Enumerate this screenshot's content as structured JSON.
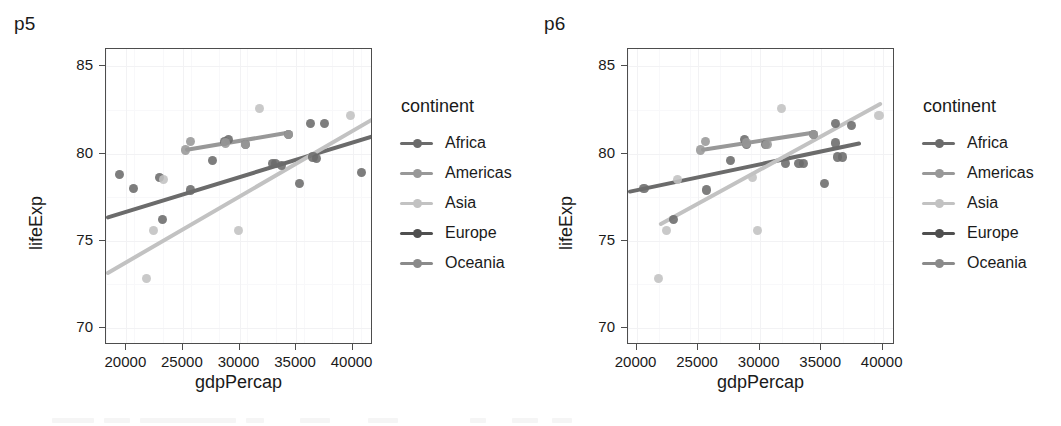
{
  "figure": {
    "background": "#ffffff",
    "panels": [
      {
        "tag": "p5",
        "x_title": "gdpPercap",
        "y_title": "lifeExp",
        "legend_title": "continent"
      },
      {
        "tag": "p6",
        "x_title": "gdpPercap",
        "y_title": "lifeExp",
        "legend_title": "continent"
      }
    ]
  },
  "palette": {
    "africa": "#6b6b6b",
    "americas": "#989898",
    "asia": "#c2c2c2",
    "europe": "#4f4f4f",
    "oceania": "#8a8a8a",
    "panel_border": "#4d4d4d",
    "gridline": "#f2f2f4",
    "text": "#1a1a1a"
  },
  "legend": {
    "title": "continent",
    "items": [
      {
        "label": "Africa",
        "color": "#6b6b6b"
      },
      {
        "label": "Americas",
        "color": "#989898"
      },
      {
        "label": "Asia",
        "color": "#c2c2c2"
      },
      {
        "label": "Europe",
        "color": "#4f4f4f"
      },
      {
        "label": "Oceania",
        "color": "#8a8a8a"
      }
    ]
  },
  "chart_data": [
    {
      "id": "p5",
      "type": "scatter",
      "title": "p5",
      "xlabel": "gdpPercap",
      "ylabel": "lifeExp",
      "xlim": [
        18200,
        41800
      ],
      "ylim": [
        69.0,
        86.0
      ],
      "xticks": [
        20000,
        25000,
        30000,
        35000,
        40000
      ],
      "yticks": [
        70,
        75,
        80,
        85
      ],
      "xticklabels": [
        "20000",
        "25000",
        "30000",
        "35000",
        "40000"
      ],
      "yticklabels": [
        "70",
        "75",
        "80",
        "85"
      ],
      "grid": true,
      "legend": "right",
      "legend_title": "continent",
      "series": [
        {
          "name": "Africa",
          "color": "#6b6b6b",
          "points": [
            [
              20600,
              78.0
            ],
            [
              22900,
              78.6
            ],
            [
              25700,
              77.9
            ],
            [
              23200,
              76.2
            ],
            [
              28700,
              80.7
            ],
            [
              30500,
              80.5
            ],
            [
              32900,
              79.4
            ],
            [
              33700,
              79.3
            ],
            [
              34300,
              81.1
            ],
            [
              36300,
              81.7
            ],
            [
              37500,
              81.7
            ],
            [
              36500,
              79.8
            ],
            [
              36800,
              79.7
            ],
            [
              35300,
              78.3
            ],
            [
              27600,
              79.6
            ],
            [
              29000,
              80.8
            ],
            [
              33200,
              79.4
            ],
            [
              40800,
              78.9
            ],
            [
              19400,
              78.8
            ]
          ],
          "fit": {
            "x0": 18200,
            "y0": 76.3,
            "x1": 41800,
            "y1": 81.0
          }
        },
        {
          "name": "Americas",
          "color": "#989898",
          "points": [
            [
              25200,
              80.2
            ],
            [
              25700,
              80.7
            ],
            [
              28800,
              80.6
            ],
            [
              30500,
              80.5
            ],
            [
              34300,
              81.1
            ]
          ],
          "fit": {
            "x0": 25200,
            "y0": 80.2,
            "x1": 34400,
            "y1": 81.2
          }
        },
        {
          "name": "Asia",
          "color": "#c2c2c2",
          "points": [
            [
              21800,
              72.8
            ],
            [
              22400,
              75.6
            ],
            [
              23300,
              78.5
            ],
            [
              29900,
              75.6
            ],
            [
              31800,
              82.6
            ],
            [
              39800,
              82.2
            ]
          ],
          "fit": {
            "x0": 18200,
            "y0": 73.1,
            "x1": 41800,
            "y1": 82.0
          }
        },
        {
          "name": "Europe",
          "color": "#4f4f4f",
          "points": [],
          "fit": null
        },
        {
          "name": "Oceania",
          "color": "#8a8a8a",
          "points": [],
          "fit": null
        }
      ]
    },
    {
      "id": "p6",
      "type": "scatter",
      "title": "p6",
      "xlabel": "gdpPercap",
      "ylabel": "lifeExp",
      "xlim": [
        19300,
        41000
      ],
      "ylim": [
        69.0,
        86.0
      ],
      "xticks": [
        20000,
        25000,
        30000,
        35000,
        40000
      ],
      "yticks": [
        70,
        75,
        80,
        85
      ],
      "xticklabels": [
        "20000",
        "25000",
        "30000",
        "35000",
        "40000"
      ],
      "yticklabels": [
        "70",
        "75",
        "80",
        "85"
      ],
      "grid": true,
      "legend": "right",
      "legend_title": "continent",
      "series": [
        {
          "name": "Africa",
          "color": "#6b6b6b",
          "points": [
            [
              20600,
              78.0
            ],
            [
              23000,
              76.2
            ],
            [
              25700,
              77.9
            ],
            [
              27600,
              79.6
            ],
            [
              28800,
              80.8
            ],
            [
              28900,
              80.5
            ],
            [
              30500,
              80.5
            ],
            [
              32100,
              79.4
            ],
            [
              33200,
              79.4
            ],
            [
              33600,
              79.4
            ],
            [
              34400,
              81.1
            ],
            [
              36200,
              81.7
            ],
            [
              36300,
              79.8
            ],
            [
              36700,
              79.8
            ],
            [
              37500,
              81.6
            ],
            [
              35300,
              78.3
            ],
            [
              36200,
              80.6
            ]
          ],
          "fit": {
            "x0": 19300,
            "y0": 77.8,
            "x1": 38200,
            "y1": 80.6
          }
        },
        {
          "name": "Americas",
          "color": "#989898",
          "points": [
            [
              25200,
              80.2
            ],
            [
              25600,
              80.7
            ],
            [
              28900,
              80.6
            ],
            [
              30600,
              80.5
            ],
            [
              34400,
              81.1
            ]
          ],
          "fit": {
            "x0": 25200,
            "y0": 80.2,
            "x1": 34400,
            "y1": 81.2
          }
        },
        {
          "name": "Asia",
          "color": "#c2c2c2",
          "points": [
            [
              21800,
              72.8
            ],
            [
              22400,
              75.6
            ],
            [
              23300,
              78.5
            ],
            [
              29800,
              75.6
            ],
            [
              29400,
              78.6
            ],
            [
              31800,
              82.6
            ],
            [
              39700,
              82.2
            ]
          ],
          "fit": {
            "x0": 21800,
            "y0": 75.9,
            "x1": 39900,
            "y1": 82.9
          }
        },
        {
          "name": "Europe",
          "color": "#4f4f4f",
          "points": [],
          "fit": null
        },
        {
          "name": "Oceania",
          "color": "#8a8a8a",
          "points": [],
          "fit": null
        }
      ]
    }
  ]
}
